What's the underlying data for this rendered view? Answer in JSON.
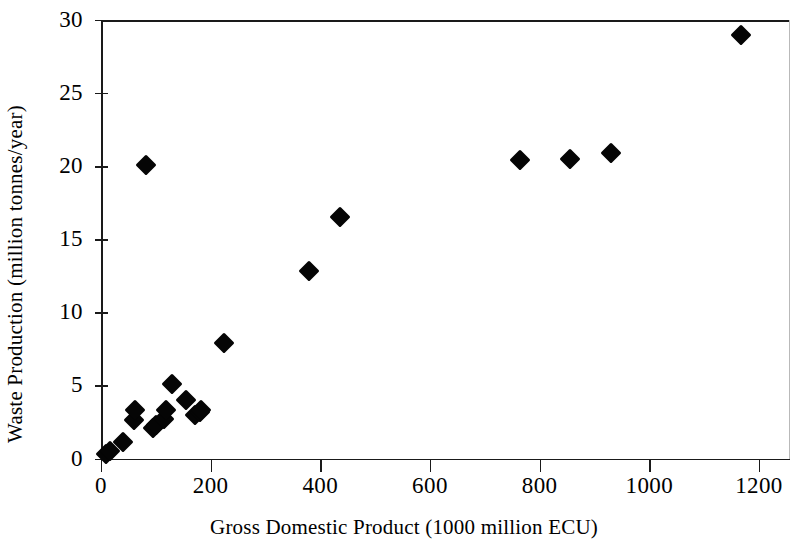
{
  "chart_data": {
    "type": "scatter",
    "title": "",
    "xlabel": "Gross Domestic Product (1000 million ECU)",
    "ylabel": "Waste Production (million tonnes/year)",
    "xlim": [
      0,
      1250
    ],
    "ylim": [
      0,
      30
    ],
    "xticks": [
      0,
      200,
      400,
      600,
      800,
      1000,
      1200
    ],
    "xticklabels": [
      "0",
      "200",
      "400",
      "600",
      "800",
      "1000",
      "1200"
    ],
    "yticks": [
      0,
      5,
      10,
      15,
      20,
      25,
      30
    ],
    "yticklabels": [
      "0",
      "5",
      "10",
      "15",
      "20",
      "25",
      "30"
    ],
    "grid": false,
    "legend": false,
    "marker": "filled-diamond",
    "marker_color": "#050505",
    "axis_color": "#1a1a1a",
    "background_color": "#ffffff",
    "points": [
      {
        "x": 10,
        "y": 0.3
      },
      {
        "x": 16,
        "y": 0.5
      },
      {
        "x": 40,
        "y": 1.1
      },
      {
        "x": 60,
        "y": 2.6
      },
      {
        "x": 62,
        "y": 3.3
      },
      {
        "x": 82,
        "y": 20.1
      },
      {
        "x": 95,
        "y": 2.1
      },
      {
        "x": 100,
        "y": 2.3
      },
      {
        "x": 115,
        "y": 2.7
      },
      {
        "x": 118,
        "y": 3.3
      },
      {
        "x": 130,
        "y": 5.1
      },
      {
        "x": 155,
        "y": 4.0
      },
      {
        "x": 172,
        "y": 3.0
      },
      {
        "x": 180,
        "y": 3.2
      },
      {
        "x": 183,
        "y": 3.3
      },
      {
        "x": 225,
        "y": 7.9
      },
      {
        "x": 380,
        "y": 12.8
      },
      {
        "x": 435,
        "y": 16.5
      },
      {
        "x": 765,
        "y": 20.4
      },
      {
        "x": 855,
        "y": 20.5
      },
      {
        "x": 930,
        "y": 20.9
      },
      {
        "x": 1168,
        "y": 29.0
      }
    ]
  }
}
